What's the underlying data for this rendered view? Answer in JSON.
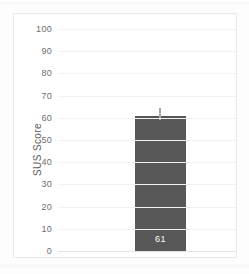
{
  "chart_data": {
    "type": "bar",
    "title": "",
    "xlabel": "",
    "ylabel": "SUS Score",
    "categories": [
      ""
    ],
    "values": [
      61
    ],
    "data_labels": [
      "61"
    ],
    "errors": [
      3.5
    ],
    "ylim": [
      0,
      100
    ],
    "yticks": [
      0,
      10,
      20,
      30,
      40,
      50,
      60,
      70,
      80,
      90,
      100
    ],
    "ytick_labels": [
      "0",
      "10",
      "20",
      "30",
      "40",
      "50",
      "60",
      "70",
      "80",
      "90",
      "100"
    ],
    "grid": true,
    "legend": false,
    "colors": {
      "bar": "#585858",
      "error_bar": "#a9a9a9",
      "gridline": "#f2f2f4",
      "baseline": "#e4e4e6",
      "frame": "#e9e9ec",
      "plot_background": "#ffffff",
      "page_background": "#fdfdfd",
      "tick_label": "#6e6e6e",
      "axis_title": "#5d5d5d",
      "data_label": "#ffffff"
    }
  }
}
